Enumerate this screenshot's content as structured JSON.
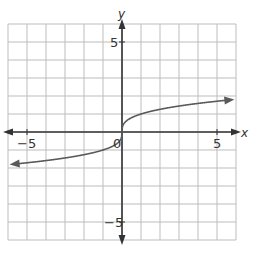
{
  "chart_data": {
    "type": "line",
    "title": "",
    "xlabel": "x",
    "ylabel": "y",
    "xlim": [
      -6,
      6
    ],
    "ylim": [
      -6,
      6
    ],
    "grid": true,
    "x_ticks_labeled": [
      "-5",
      "5"
    ],
    "y_ticks_labeled": [
      "5",
      "-5"
    ],
    "origin_label": "0",
    "series": [
      {
        "name": "y = cube root of x",
        "x": [
          -6,
          -5,
          -4,
          -3,
          -2,
          -1,
          -0.5,
          0,
          0.5,
          1,
          2,
          3,
          4,
          5,
          6
        ],
        "values": [
          -1.82,
          -1.71,
          -1.59,
          -1.44,
          -1.26,
          -1.0,
          -0.79,
          0,
          0.79,
          1.0,
          1.26,
          1.44,
          1.59,
          1.71,
          1.82
        ],
        "arrows_both_ends": true
      }
    ]
  },
  "labels": {
    "x_axis": "x",
    "y_axis": "y",
    "x_neg5": "−5",
    "x_pos5": "5",
    "y_pos5": "5",
    "y_neg5": "−5",
    "origin": "0"
  },
  "colors": {
    "grid": "#bdbdbd",
    "axis": "#333333",
    "curve": "#5a5a5a"
  }
}
